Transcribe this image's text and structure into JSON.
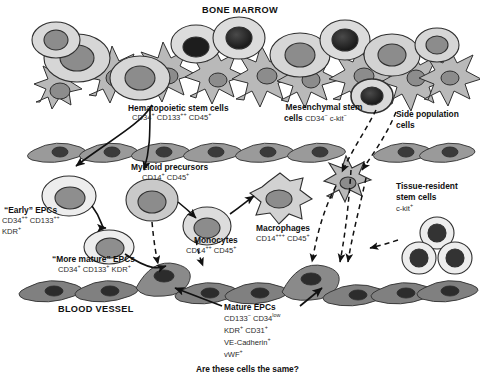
{
  "figure": {
    "title_top": "BONE MARROW",
    "title_bottom": "BLOOD VESSEL",
    "question": "Are these cells the same?"
  },
  "labels": {
    "hsc": {
      "name": "Hematopoietic stem cells",
      "markers": "CD34+ CD133++ CD45+"
    },
    "msc": {
      "name": "Mesenchymal stem\ncells",
      "markers": "CD34− c-kit−"
    },
    "sp": {
      "name": "Side population\ncells",
      "markers": ""
    },
    "early_epc": {
      "name": "“Early” EPCs",
      "markers": "CD34++ CD133++\nKDR+"
    },
    "more_mature_epc": {
      "name": "“More mature” EPCs",
      "markers": "CD34+ CD133+ KDR+"
    },
    "myeloid": {
      "name": "Myeloid precursors",
      "markers": "CD14+ CD45+"
    },
    "monocytes": {
      "name": "Monocytes",
      "markers": "CD14++ CD45+"
    },
    "macrophages": {
      "name": "Macrophages",
      "markers": "CD14+++ CD45+"
    },
    "tissue_resident": {
      "name": "Tissue-resident\nstem cells",
      "markers": "c-kit+"
    },
    "mature_epc": {
      "name": "Mature EPCs",
      "markers": "CD133− CD34low\nKDR+ CD31+\nVE-Cadherin+\nvWF+"
    }
  },
  "colors": {
    "stroma": "#b9b9b9",
    "stroma_stroke": "#2f2f2f",
    "cell_pale": "#e6e6e6",
    "cell_mid": "#c9c9c9",
    "nucleus_gray": "#8c8c8c",
    "nucleus_dark": "#1d1d1d",
    "vessel_top": "#9a9a9a",
    "vessel_bottom": "#808080",
    "vessel_nucleus": "#3a3a3a",
    "ink": "#111111"
  },
  "icons": {
    "stromal": "spiky-stromal-cell-icon",
    "round": "round-cell-icon",
    "macrophage": "amoeboid-macrophage-icon",
    "endothelial": "endothelial-cell-icon",
    "arrow_solid": "solid-arrow-icon",
    "arrow_dashed": "dashed-arrow-icon"
  }
}
